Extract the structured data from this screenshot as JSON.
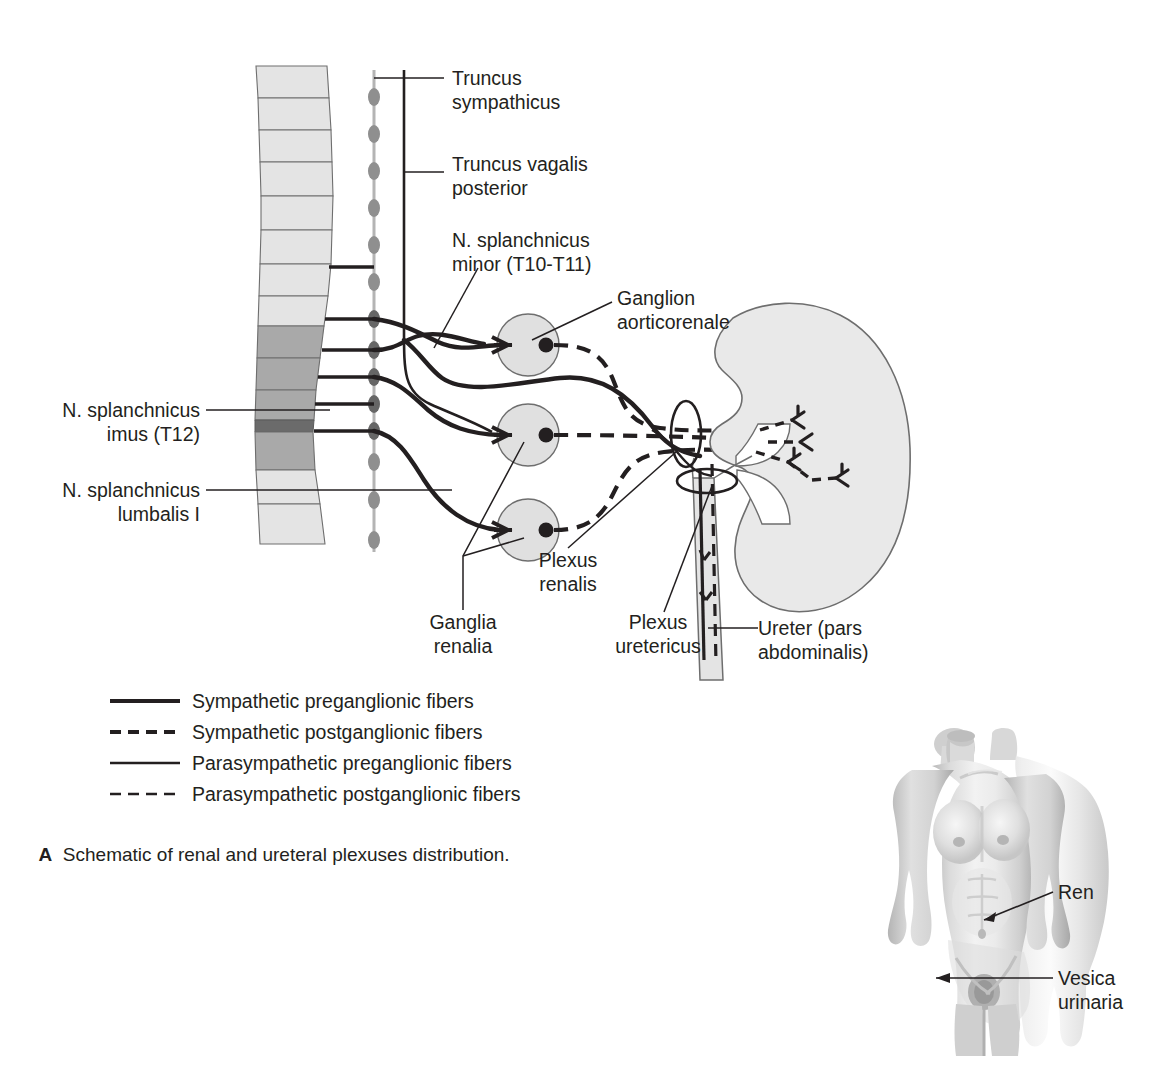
{
  "figure": {
    "caption_letter": "A",
    "caption_text": "Schematic of renal and ureteral plexuses distribution."
  },
  "labels": {
    "truncus_sympathicus": "Truncus\nsympathicus",
    "truncus_vagalis_posterior": "Truncus vagalis\nposterior",
    "n_splanchnicus_minor": "N. splanchnicus\nminor (T10-T11)",
    "ganglion_aorticorenale": "Ganglion\naorticorenale",
    "n_splanchnicus_imus": "N. splanchnicus\nimus (T12)",
    "n_splanchnicus_lumbalis": "N. splanchnicus\nlumbalis I",
    "ganglia_renalia": "Ganglia\nrenalia",
    "plexus_renalis": "Plexus\nrenalis",
    "plexus_uretericus": "Plexus\nuretericus",
    "ureter": "Ureter (pars\nabdominalis)",
    "ren": "Ren",
    "vesica_urinaria": "Vesica\nurinaria"
  },
  "legend": {
    "items": [
      {
        "label": "Sympathetic preganglionic fibers",
        "style": "solid",
        "weight": 4.0
      },
      {
        "label": "Sympathetic postganglionic fibers",
        "style": "dashed",
        "weight": 4.0
      },
      {
        "label": "Parasympathetic preganglionic fibers",
        "style": "solid",
        "weight": 2.6
      },
      {
        "label": "Parasympathetic postganglionic fibers",
        "style": "dashed",
        "weight": 2.6
      }
    ]
  },
  "colors": {
    "ink": "#231f20",
    "vertebra_light": "#e4e4e4",
    "vertebra_dark": "#a9a9a9",
    "ganglion_fill": "#e0e0e0",
    "kidney_fill": "#e9e9e9",
    "ureter_fill": "#e4e4e4",
    "trunk_chain": "#8f8f8f",
    "body_photo": "#bdbdbd"
  },
  "anatomy": {
    "vertebra_count": 15,
    "ganglia_renalia_count": 2,
    "ganglion_aorticorenale_count": 1,
    "sympathetic_chain_ganglia": 13,
    "rami_count": 6
  }
}
